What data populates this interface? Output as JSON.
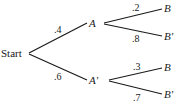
{
  "diagram": {
    "type": "probability-tree",
    "root": {
      "label": "Start"
    },
    "level1": [
      {
        "label": "A",
        "probability": ".4"
      },
      {
        "label": "A'",
        "probability": ".6"
      }
    ],
    "level2": {
      "A": [
        {
          "label": "B",
          "probability": ".2"
        },
        {
          "label": "B'",
          "probability": ".8"
        }
      ],
      "A_prime": [
        {
          "label": "B",
          "probability": ".3"
        },
        {
          "label": "B'",
          "probability": ".7"
        }
      ]
    }
  }
}
